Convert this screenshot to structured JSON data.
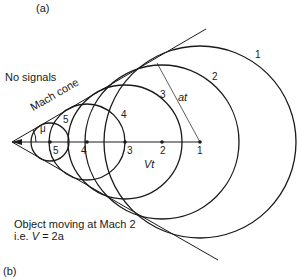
{
  "panel_top_label": "(a)",
  "panel_bottom_label": "(b)",
  "region_label": "No signals",
  "cone_label": "Mach cone",
  "angle_label": "μ",
  "distance_label_radius": "at",
  "distance_label_travel": "Vt",
  "caption_line1": "Object moving at Mach 2",
  "caption_line2_prefix": "i.e. ",
  "caption_line2_var": "V",
  "caption_line2_rest": " = 2a",
  "points": [
    {
      "label": "1",
      "x": 200,
      "radius": 96
    },
    {
      "label": "2",
      "x": 162,
      "radius": 77
    },
    {
      "label": "3",
      "x": 125,
      "radius": 57
    },
    {
      "label": "4",
      "x": 87,
      "radius": 38
    },
    {
      "label": "5",
      "x": 50,
      "radius": 19
    }
  ],
  "circle_labels": [
    "1",
    "2",
    "3",
    "4",
    "5"
  ],
  "axis_y": 142,
  "apex_x": 12,
  "colors": {
    "line": "#1a1a1a",
    "background": "#ffffff"
  }
}
